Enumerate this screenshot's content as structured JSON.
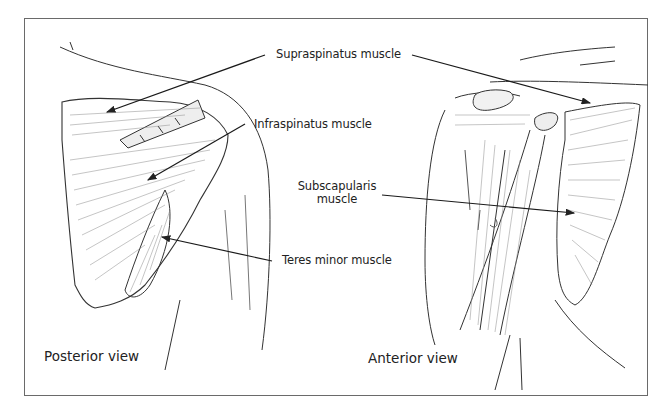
{
  "diagram": {
    "type": "anatomical-illustration",
    "colors": {
      "ink": "#222222",
      "frame": "#6a6a6a",
      "background": "#ffffff",
      "hatch": "#8a8a8a"
    },
    "labels": {
      "supraspinatus": "Supraspinatus muscle",
      "infraspinatus": "Infraspinatus muscle",
      "subscapularis_line1": "Subscapularis",
      "subscapularis_line2": "muscle",
      "teres_minor": "Teres minor muscle"
    },
    "views": {
      "posterior": "Posterior view",
      "anterior": "Anterior view"
    }
  }
}
